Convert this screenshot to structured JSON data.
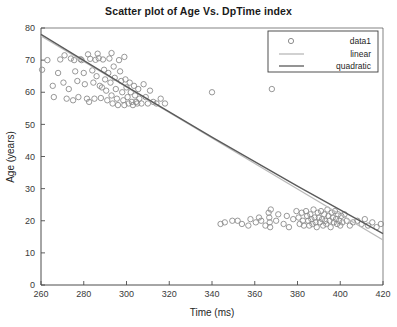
{
  "chart_data": {
    "type": "scatter",
    "title": "Scatter plot of Age Vs. DpTime index",
    "xlabel": "Time (ms)",
    "ylabel": "Age (years)",
    "xlim": [
      260,
      420
    ],
    "ylim": [
      0,
      80
    ],
    "xticks": [
      260,
      280,
      300,
      320,
      340,
      360,
      380,
      400,
      420
    ],
    "yticks": [
      0,
      10,
      20,
      30,
      40,
      50,
      60,
      70,
      80
    ],
    "grid": false,
    "legend_position": "top-right",
    "marker": "open-circle",
    "marker_color": "#8c8c8c",
    "series": [
      {
        "name": "data1",
        "type": "scatter",
        "points": [
          [
            260.5,
            67.0
          ],
          [
            263.0,
            70.0
          ],
          [
            265.5,
            62.0
          ],
          [
            266.0,
            58.5
          ],
          [
            269.0,
            70.2
          ],
          [
            270.5,
            63.0
          ],
          [
            272.0,
            58.0
          ],
          [
            274.0,
            70.5
          ],
          [
            275.5,
            70.0
          ],
          [
            276.0,
            66.5
          ],
          [
            277.0,
            63.5
          ],
          [
            277.5,
            58.5
          ],
          [
            278.5,
            70.3
          ],
          [
            279.0,
            70.0
          ],
          [
            280.0,
            66.0
          ],
          [
            280.5,
            62.5
          ],
          [
            281.5,
            58.0
          ],
          [
            283.0,
            70.4
          ],
          [
            284.0,
            66.8
          ],
          [
            284.5,
            63.0
          ],
          [
            285.5,
            70.1
          ],
          [
            286.0,
            65.0
          ],
          [
            287.0,
            70.6
          ],
          [
            287.5,
            62.0
          ],
          [
            288.0,
            58.2
          ],
          [
            289.0,
            70.2
          ],
          [
            289.5,
            67.0
          ],
          [
            290.0,
            64.0
          ],
          [
            290.5,
            60.5
          ],
          [
            291.0,
            57.5
          ],
          [
            291.5,
            66.0
          ],
          [
            292.0,
            70.5
          ],
          [
            292.5,
            63.0
          ],
          [
            293.0,
            59.0
          ],
          [
            293.5,
            56.5
          ],
          [
            294.0,
            68.0
          ],
          [
            294.5,
            64.5
          ],
          [
            295.0,
            61.0
          ],
          [
            295.5,
            58.0
          ],
          [
            296.0,
            56.0
          ],
          [
            296.5,
            70.0
          ],
          [
            297.0,
            66.5
          ],
          [
            297.5,
            63.5
          ],
          [
            298.0,
            60.0
          ],
          [
            298.5,
            57.5
          ],
          [
            299.0,
            56.0
          ],
          [
            299.5,
            64.0
          ],
          [
            300.0,
            61.5
          ],
          [
            300.5,
            58.5
          ],
          [
            301.0,
            56.5
          ],
          [
            301.5,
            63.0
          ],
          [
            302.0,
            60.0
          ],
          [
            302.5,
            57.0
          ],
          [
            303.0,
            56.0
          ],
          [
            303.5,
            62.0
          ],
          [
            304.0,
            59.0
          ],
          [
            304.5,
            57.0
          ],
          [
            305.0,
            56.5
          ],
          [
            305.5,
            61.0
          ],
          [
            306.0,
            58.0
          ],
          [
            307.0,
            56.5
          ],
          [
            308.0,
            62.5
          ],
          [
            309.0,
            58.5
          ],
          [
            310.0,
            56.5
          ],
          [
            311.0,
            60.5
          ],
          [
            312.5,
            57.0
          ],
          [
            314.0,
            56.5
          ],
          [
            316.0,
            58.0
          ],
          [
            318.0,
            56.5
          ],
          [
            271.0,
            71.5
          ],
          [
            282.0,
            71.8
          ],
          [
            286.5,
            72.0
          ],
          [
            293.0,
            72.2
          ],
          [
            299.0,
            71.0
          ],
          [
            268.0,
            66.0
          ],
          [
            273.0,
            61.0
          ],
          [
            275.0,
            57.5
          ],
          [
            282.5,
            57.0
          ],
          [
            285.0,
            58.0
          ],
          [
            288.5,
            61.5
          ],
          [
            340.0,
            60.0
          ],
          [
            368.0,
            61.0
          ],
          [
            346.0,
            19.5
          ],
          [
            349.5,
            20.0
          ],
          [
            354.0,
            19.0
          ],
          [
            358.0,
            20.5
          ],
          [
            360.5,
            19.5
          ],
          [
            362.0,
            21.0
          ],
          [
            365.0,
            18.5
          ],
          [
            366.5,
            22.5
          ],
          [
            366.8,
            21.0
          ],
          [
            367.0,
            19.5
          ],
          [
            367.2,
            18.0
          ],
          [
            367.5,
            23.5
          ],
          [
            370.0,
            20.0
          ],
          [
            371.0,
            22.0
          ],
          [
            373.5,
            19.0
          ],
          [
            375.0,
            21.5
          ],
          [
            376.0,
            18.0
          ],
          [
            378.0,
            20.5
          ],
          [
            379.5,
            23.0
          ],
          [
            380.5,
            21.0
          ],
          [
            381.0,
            19.0
          ],
          [
            382.0,
            22.5
          ],
          [
            382.5,
            20.0
          ],
          [
            383.0,
            18.5
          ],
          [
            384.0,
            23.0
          ],
          [
            384.5,
            21.5
          ],
          [
            385.0,
            20.0
          ],
          [
            385.5,
            18.5
          ],
          [
            386.0,
            22.0
          ],
          [
            386.5,
            20.5
          ],
          [
            387.0,
            19.0
          ],
          [
            387.5,
            23.5
          ],
          [
            388.0,
            21.0
          ],
          [
            388.5,
            19.5
          ],
          [
            389.0,
            18.0
          ],
          [
            389.5,
            22.5
          ],
          [
            390.0,
            21.0
          ],
          [
            390.5,
            19.5
          ],
          [
            391.0,
            23.0
          ],
          [
            391.5,
            20.5
          ],
          [
            392.0,
            18.5
          ],
          [
            392.5,
            22.0
          ],
          [
            393.0,
            20.0
          ],
          [
            393.5,
            19.0
          ],
          [
            394.0,
            23.5
          ],
          [
            394.5,
            21.5
          ],
          [
            395.0,
            20.0
          ],
          [
            395.5,
            18.0
          ],
          [
            396.0,
            22.5
          ],
          [
            396.5,
            21.0
          ],
          [
            397.0,
            19.5
          ],
          [
            397.5,
            23.0
          ],
          [
            398.0,
            20.5
          ],
          [
            398.5,
            19.0
          ],
          [
            399.0,
            22.0
          ],
          [
            399.5,
            20.0
          ],
          [
            400.0,
            18.5
          ],
          [
            400.5,
            21.5
          ],
          [
            401.0,
            19.5
          ],
          [
            402.0,
            22.0
          ],
          [
            403.0,
            20.0
          ],
          [
            404.5,
            18.5
          ],
          [
            406.0,
            19.5
          ],
          [
            408.0,
            20.0
          ],
          [
            410.0,
            19.0
          ],
          [
            411.5,
            20.5
          ],
          [
            413.0,
            18.5
          ],
          [
            415.0,
            19.5
          ],
          [
            417.0,
            18.0
          ],
          [
            419.0,
            19.0
          ],
          [
            344.0,
            19.0
          ],
          [
            352.0,
            20.0
          ],
          [
            357.0,
            18.5
          ],
          [
            363.0,
            20.0
          ]
        ]
      },
      {
        "name": "linear",
        "type": "line",
        "color": "#b9b9b9",
        "endpoints": [
          [
            260,
            77.5
          ],
          [
            420,
            14.0
          ]
        ]
      },
      {
        "name": "quadratic",
        "type": "line",
        "color": "#5a5a5a",
        "endpoints": [
          [
            260,
            78.0
          ],
          [
            420,
            16.0
          ]
        ],
        "curve_control": [
          340,
          46.0
        ]
      }
    ],
    "legend_entries": [
      {
        "label": "data1",
        "glyph": "circle-marker",
        "color": "#8c8c8c"
      },
      {
        "label": "linear",
        "glyph": "line-swatch",
        "color": "#b9b9b9"
      },
      {
        "label": "quadratic",
        "glyph": "line-swatch",
        "color": "#5a5a5a"
      }
    ]
  }
}
